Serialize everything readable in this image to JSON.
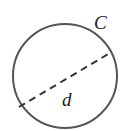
{
  "diagram": {
    "title": "",
    "labels": {
      "circumference": "C",
      "diameter": "d"
    },
    "circle": {
      "cx": 65,
      "cy": 76,
      "r": 52
    },
    "diameter_line": {
      "x1": 19,
      "y1": 107,
      "x2": 110,
      "y2": 53,
      "style": "dashed"
    },
    "colors": {
      "stroke": "#555555",
      "text": "#222222",
      "background": "#ffffff"
    }
  }
}
